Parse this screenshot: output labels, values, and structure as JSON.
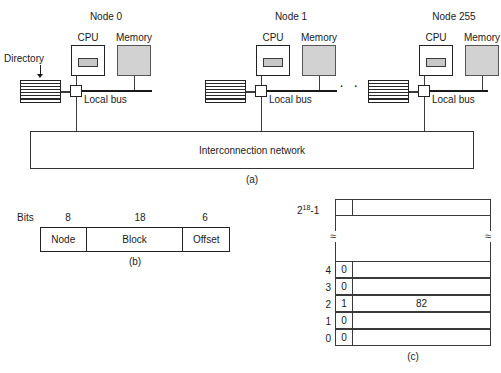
{
  "figure": {
    "panel_a": {
      "caption": "(a)",
      "nodes": [
        {
          "title": "Node 0",
          "cpu_label": "CPU",
          "memory_label": "Memory",
          "bus_label": "Local bus"
        },
        {
          "title": "Node 1",
          "cpu_label": "CPU",
          "memory_label": "Memory",
          "bus_label": "Local bus"
        },
        {
          "title": "Node 255",
          "cpu_label": "CPU",
          "memory_label": "Memory",
          "bus_label": "Local bus"
        }
      ],
      "directory_label": "Directory",
      "ellipsis": "· · ·",
      "network_label": "Interconnection network"
    },
    "panel_b": {
      "caption": "(b)",
      "bits_label": "Bits",
      "fields": [
        {
          "width_bits": "8",
          "name": "Node"
        },
        {
          "width_bits": "18",
          "name": "Block"
        },
        {
          "width_bits": "6",
          "name": "Offset"
        }
      ]
    },
    "panel_c": {
      "caption": "(c)",
      "top_index": "2",
      "top_index_sup": "18",
      "top_index_suffix": "-1",
      "break_symbol": "≈",
      "rows": [
        {
          "index": "4",
          "bit": "0",
          "value": ""
        },
        {
          "index": "3",
          "bit": "0",
          "value": ""
        },
        {
          "index": "2",
          "bit": "1",
          "value": "82"
        },
        {
          "index": "1",
          "bit": "0",
          "value": ""
        },
        {
          "index": "0",
          "bit": "0",
          "value": ""
        }
      ]
    }
  },
  "colors": {
    "memory_fill": "#d2d2d2",
    "cache_fill": "#c8c8c8",
    "line": "#222222",
    "background": "#ffffff"
  }
}
